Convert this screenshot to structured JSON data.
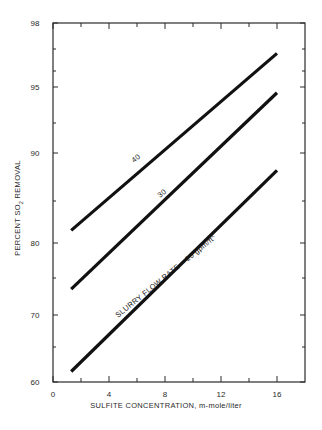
{
  "chart_data": {
    "type": "line",
    "title": "",
    "xlabel": "SULFITE CONCENTRATION, m-mole/liter",
    "ylabel": "PERCENT SO2 REMOVAL",
    "ylabel_parts": {
      "pre": "PERCENT SO",
      "sub": "2",
      "post": " REMOVAL"
    },
    "xlim": [
      0,
      18
    ],
    "ylim": [
      60,
      98
    ],
    "y_scale": "nonlinear (probability-style)",
    "x_ticks": [
      0,
      4,
      8,
      12,
      16
    ],
    "x_tick_labels": [
      "0",
      "4",
      "8",
      "12",
      "16"
    ],
    "x_minor_ticks": [
      2,
      6,
      10,
      14
    ],
    "y_ticks": [
      60,
      70,
      80,
      90,
      95,
      98
    ],
    "y_tick_labels": [
      "60",
      "70",
      "80",
      "90",
      "95",
      "98"
    ],
    "y_minor_ticks": [
      65,
      75,
      85,
      92.5,
      96.5,
      97.5
    ],
    "grid": false,
    "legend": "none (inline labels on lines)",
    "series": [
      {
        "name": "40",
        "label": "40",
        "x": [
          1.3,
          16
        ],
        "values": [
          81.5,
          97.3
        ]
      },
      {
        "name": "30",
        "label": "30",
        "x": [
          1.3,
          16
        ],
        "values": [
          73.5,
          94.6
        ]
      },
      {
        "name": "20",
        "label": "SLURRY FLOW RATE = 20 gpm/ft2",
        "label_parts": {
          "main": "SLURRY FLOW RATE = 20 gpm/ft",
          "sup": "2"
        },
        "x": [
          1.3,
          16
        ],
        "values": [
          61.5,
          88.2
        ]
      }
    ]
  }
}
